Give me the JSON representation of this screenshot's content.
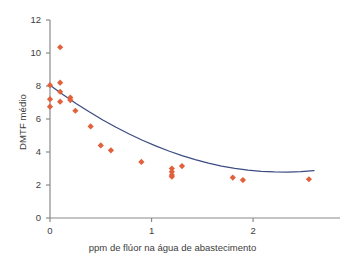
{
  "chart_data": {
    "type": "scatter",
    "title": "",
    "xlabel": "ppm de flúor na água de abastecimento",
    "ylabel": "DMTF médio",
    "xlim": [
      0,
      2.6
    ],
    "ylim": [
      0,
      12
    ],
    "xticks": [
      0,
      1,
      2
    ],
    "xtick_labels": [
      "0",
      "1",
      "2"
    ],
    "yticks": [
      0,
      2,
      4,
      6,
      8,
      10,
      12
    ],
    "ytick_labels": [
      "0",
      "2",
      "4",
      "6",
      "8",
      "10",
      "12"
    ],
    "grid": false,
    "legend": null,
    "series": [
      {
        "name": "observações",
        "type": "scatter",
        "marker": "diamond",
        "color": "#E2603C",
        "points": [
          [
            0.0,
            8.05
          ],
          [
            0.0,
            7.2
          ],
          [
            0.0,
            6.75
          ],
          [
            0.1,
            10.35
          ],
          [
            0.1,
            8.2
          ],
          [
            0.1,
            7.65
          ],
          [
            0.1,
            7.05
          ],
          [
            0.2,
            7.3
          ],
          [
            0.2,
            7.15
          ],
          [
            0.25,
            6.5
          ],
          [
            0.4,
            5.55
          ],
          [
            0.5,
            4.4
          ],
          [
            0.6,
            4.1
          ],
          [
            0.9,
            3.4
          ],
          [
            1.2,
            3.0
          ],
          [
            1.2,
            2.8
          ],
          [
            1.2,
            2.6
          ],
          [
            1.2,
            2.5
          ],
          [
            1.3,
            3.15
          ],
          [
            1.8,
            2.45
          ],
          [
            1.9,
            2.3
          ],
          [
            2.55,
            2.35
          ]
        ]
      },
      {
        "name": "curva ajustada",
        "type": "line",
        "color": "#3B4C82",
        "fit": "quadrática",
        "points": [
          [
            0.0,
            8.05
          ],
          [
            0.13,
            7.47
          ],
          [
            0.26,
            6.93
          ],
          [
            0.39,
            6.42
          ],
          [
            0.52,
            5.94
          ],
          [
            0.65,
            5.5
          ],
          [
            0.78,
            5.09
          ],
          [
            0.91,
            4.71
          ],
          [
            1.04,
            4.37
          ],
          [
            1.17,
            4.06
          ],
          [
            1.3,
            3.78
          ],
          [
            1.43,
            3.54
          ],
          [
            1.56,
            3.33
          ],
          [
            1.69,
            3.15
          ],
          [
            1.82,
            3.01
          ],
          [
            1.95,
            2.9
          ],
          [
            2.08,
            2.83
          ],
          [
            2.21,
            2.79
          ],
          [
            2.34,
            2.78
          ],
          [
            2.47,
            2.81
          ],
          [
            2.6,
            2.87
          ]
        ]
      }
    ]
  },
  "axis": {
    "line_color": "#8a8a8a"
  }
}
